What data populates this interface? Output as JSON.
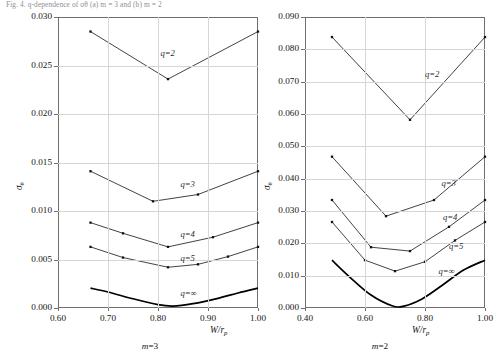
{
  "caption": "Fig. 4.  q-dependence of σθ (a) m = 3 and (b) m = 2",
  "figure": {
    "panels": [
      {
        "id": "left",
        "panel_label": "m=3",
        "panel_label_var": "m",
        "panel_label_value": "=3",
        "ylabel_main": "σ",
        "ylabel_sub": "θ",
        "xlabel_main": "W/r",
        "xlabel_sub": "p",
        "xticks": [
          "0.60",
          "0.70",
          "0.80",
          "0.90",
          "1.00"
        ],
        "yticks": [
          "0.000",
          "0.005",
          "0.010",
          "0.015",
          "0.020",
          "0.025",
          "0.030"
        ],
        "curve_labels": [
          "q=2",
          "q=3",
          "q=4",
          "q=5",
          "q=∞"
        ]
      },
      {
        "id": "right",
        "panel_label": "m=2",
        "panel_label_var": "m",
        "panel_label_value": "=2",
        "ylabel_main": "σ",
        "ylabel_sub": "θ",
        "xlabel_main": "W/r",
        "xlabel_sub": "p",
        "xticks": [
          "0.40",
          "0.60",
          "0.80",
          "1.00"
        ],
        "yticks": [
          "0.000",
          "0.010",
          "0.020",
          "0.030",
          "0.040",
          "0.050",
          "0.060",
          "0.070",
          "0.080",
          "0.090"
        ],
        "curve_labels": [
          "q=2",
          "q=3",
          "q=4",
          "q=5",
          "q=∞"
        ]
      }
    ]
  },
  "chart_data": [
    {
      "type": "line",
      "id": "left-panel",
      "title": "m=3",
      "xlabel": "W/r_p",
      "ylabel": "sigma_theta",
      "xlim": [
        0.6,
        1.0
      ],
      "ylim": [
        0.0,
        0.03
      ],
      "xticks": [
        0.6,
        0.7,
        0.8,
        0.9,
        1.0
      ],
      "yticks": [
        0.0,
        0.005,
        0.01,
        0.015,
        0.02,
        0.025,
        0.03
      ],
      "grid": true,
      "legend": "inline-labels",
      "series": [
        {
          "name": "q=2",
          "markers": true,
          "smooth": false,
          "x": [
            0.665,
            0.82,
            1.0
          ],
          "y": [
            0.0285,
            0.0236,
            0.0285
          ]
        },
        {
          "name": "q=3",
          "markers": true,
          "smooth": false,
          "x": [
            0.665,
            0.79,
            0.88,
            1.0
          ],
          "y": [
            0.0141,
            0.011,
            0.0117,
            0.0141
          ]
        },
        {
          "name": "q=4",
          "markers": true,
          "smooth": false,
          "x": [
            0.665,
            0.73,
            0.82,
            0.91,
            1.0
          ],
          "y": [
            0.0088,
            0.0077,
            0.0063,
            0.0073,
            0.0088
          ]
        },
        {
          "name": "q=5",
          "markers": true,
          "smooth": false,
          "x": [
            0.665,
            0.73,
            0.82,
            0.88,
            0.94,
            1.0
          ],
          "y": [
            0.0063,
            0.0052,
            0.0042,
            0.0045,
            0.0053,
            0.0063
          ]
        },
        {
          "name": "q=∞",
          "markers": false,
          "smooth": true,
          "x": [
            0.665,
            0.7,
            0.75,
            0.8,
            0.83,
            0.87,
            0.92,
            0.96,
            1.0
          ],
          "y": [
            0.00205,
            0.00165,
            0.00095,
            0.00035,
            0.0002,
            0.00045,
            0.001,
            0.00155,
            0.00205
          ]
        }
      ]
    },
    {
      "type": "line",
      "id": "right-panel",
      "title": "m=2",
      "xlabel": "W/r_p",
      "ylabel": "sigma_theta",
      "xlim": [
        0.4,
        1.0
      ],
      "ylim": [
        0.0,
        0.09
      ],
      "xticks": [
        0.4,
        0.6,
        0.8,
        1.0
      ],
      "yticks": [
        0.0,
        0.01,
        0.02,
        0.03,
        0.04,
        0.05,
        0.06,
        0.07,
        0.08,
        0.09
      ],
      "grid": true,
      "legend": "inline-labels",
      "series": [
        {
          "name": "q=2",
          "markers": true,
          "smooth": false,
          "x": [
            0.49,
            0.75,
            1.0
          ],
          "y": [
            0.0838,
            0.0582,
            0.0838
          ]
        },
        {
          "name": "q=3",
          "markers": true,
          "smooth": false,
          "x": [
            0.49,
            0.67,
            0.83,
            1.0
          ],
          "y": [
            0.0468,
            0.0284,
            0.0334,
            0.0468
          ]
        },
        {
          "name": "q=4",
          "markers": true,
          "smooth": false,
          "x": [
            0.49,
            0.62,
            0.75,
            0.88,
            1.0
          ],
          "y": [
            0.0334,
            0.0188,
            0.0176,
            0.0251,
            0.0334
          ]
        },
        {
          "name": "q=5",
          "markers": true,
          "smooth": false,
          "x": [
            0.49,
            0.6,
            0.7,
            0.8,
            0.9,
            1.0
          ],
          "y": [
            0.0266,
            0.0148,
            0.0114,
            0.0143,
            0.0209,
            0.0266
          ]
        },
        {
          "name": "q=∞",
          "markers": false,
          "smooth": true,
          "x": [
            0.49,
            0.55,
            0.62,
            0.69,
            0.73,
            0.79,
            0.86,
            0.93,
            1.0
          ],
          "y": [
            0.0148,
            0.0095,
            0.004,
            0.0007,
            0.0006,
            0.0028,
            0.0072,
            0.0118,
            0.0148
          ]
        }
      ]
    }
  ]
}
